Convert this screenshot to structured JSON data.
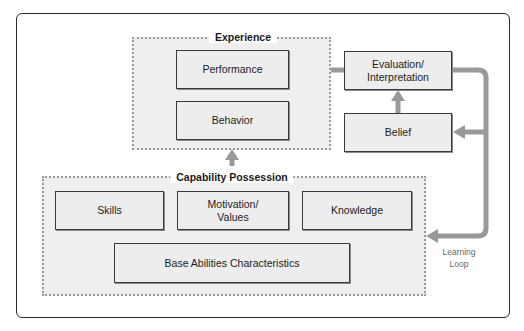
{
  "diagram": {
    "groups": {
      "experience": {
        "label": "Experience"
      },
      "capability": {
        "label": "Capability Possession"
      }
    },
    "boxes": {
      "performance": "Performance",
      "behavior": "Behavior",
      "evaluation_line1": "Evaluation/",
      "evaluation_line2": "Interpretation",
      "belief": "Belief",
      "skills": "Skills",
      "motivation_line1": "Motivation/",
      "motivation_line2": "Values",
      "knowledge": "Knowledge",
      "base_abilities": "Base Abilities Characteristics"
    },
    "loop_label": {
      "line1": "Learning",
      "line2": "Loop"
    },
    "colors": {
      "connector": "#999999",
      "box_fill": "#ededed",
      "group_fill": "#efefef",
      "border": "#3a3a3a"
    }
  }
}
